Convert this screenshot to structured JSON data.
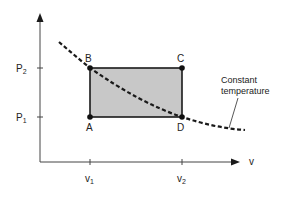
{
  "diagram": {
    "type": "pv-diagram",
    "axes": {
      "y_label": "P",
      "x_label": "v",
      "y_ticks": [
        {
          "label": "P",
          "sub": "2"
        },
        {
          "label": "P",
          "sub": "1"
        }
      ],
      "x_ticks": [
        {
          "label": "v",
          "sub": "1"
        },
        {
          "label": "v",
          "sub": "2"
        }
      ]
    },
    "points": {
      "A": "A",
      "B": "B",
      "C": "C",
      "D": "D"
    },
    "curve_label_line1": "Constant",
    "curve_label_line2": "temperature",
    "colors": {
      "rect_fill": "#c8c8c8",
      "line": "#1a1a1a"
    }
  }
}
